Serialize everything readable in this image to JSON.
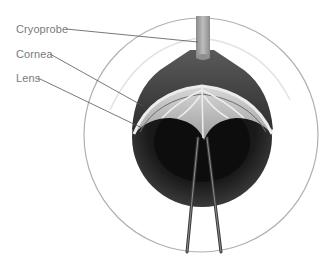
{
  "figure": {
    "labels": [
      {
        "id": "cryoprobe",
        "text": "Cryoprobe"
      },
      {
        "id": "cornea",
        "text": "Cornea"
      },
      {
        "id": "lens",
        "text": "Lens"
      }
    ]
  },
  "colors": {
    "background": "#ffffff",
    "label_text": "#7a7a7a",
    "leader_line": "#555555",
    "outer_circle": "#a8a8a8",
    "iris_dark": "#1e1e1e",
    "iris_mid": "#3c3c3c",
    "cornea_shell": "#4a4a4a",
    "lens_light": "#c9c9c9",
    "probe": "#a0a0a0"
  }
}
